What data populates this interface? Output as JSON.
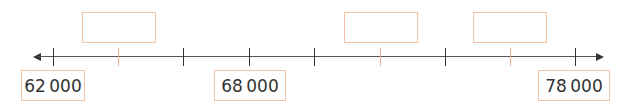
{
  "number_line": {
    "start": 62000,
    "end": 78000,
    "step": 2000,
    "ticks": [
      {
        "x": 53,
        "value": 62000,
        "color": "#333333"
      },
      {
        "x": 118,
        "value": 64000,
        "color": "#f0b08a"
      },
      {
        "x": 183,
        "value": 66000,
        "color": "#333333"
      },
      {
        "x": 249,
        "value": 68000,
        "color": "#333333"
      },
      {
        "x": 314,
        "value": 70000,
        "color": "#333333"
      },
      {
        "x": 380,
        "value": 72000,
        "color": "#f0b08a"
      },
      {
        "x": 445,
        "value": 74000,
        "color": "#333333"
      },
      {
        "x": 510,
        "value": 76000,
        "color": "#f0b08a"
      },
      {
        "x": 575,
        "value": 78000,
        "color": "#333333"
      }
    ],
    "labels": {
      "first": "62 000",
      "middle": "68 000",
      "last": "78 000"
    },
    "blank_boxes": [
      {
        "for_value": 64000,
        "content": ""
      },
      {
        "for_value": 72000,
        "content": ""
      },
      {
        "for_value": 76000,
        "content": ""
      }
    ],
    "colors": {
      "line": "#555555",
      "box_border": "#f4c4a4",
      "highlight_tick": "#f0b08a",
      "text": "#333333"
    }
  }
}
